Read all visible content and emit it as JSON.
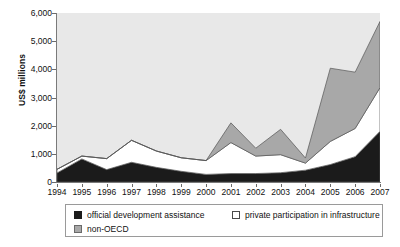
{
  "chart_data": {
    "type": "area",
    "stacked": true,
    "title": "",
    "xlabel": "",
    "ylabel": "US$ millions",
    "ylim": [
      0,
      6000
    ],
    "ytick_labels": [
      "0",
      "1,000",
      "2,000",
      "3,000",
      "4,000",
      "5,000",
      "6,000"
    ],
    "ytick_values": [
      0,
      1000,
      2000,
      3000,
      4000,
      5000,
      6000
    ],
    "grid": false,
    "legend_position": "bottom",
    "categories": [
      "1994",
      "1995",
      "1996",
      "1997",
      "1998",
      "1999",
      "2000",
      "2001",
      "2002",
      "2003",
      "2004",
      "2005",
      "2006",
      "2007"
    ],
    "series": [
      {
        "name": "official development assistance",
        "color": "#1b1b1b",
        "values": [
          320,
          820,
          440,
          700,
          520,
          380,
          270,
          300,
          300,
          330,
          420,
          620,
          900,
          1800
        ]
      },
      {
        "name": "private participation in infrastructure",
        "color": "#ffffff",
        "values": [
          130,
          100,
          390,
          780,
          580,
          480,
          490,
          1100,
          620,
          640,
          250,
          820,
          1000,
          1550
        ]
      },
      {
        "name": "non-OECD",
        "color": "#a8a8a8",
        "values": [
          0,
          0,
          0,
          0,
          0,
          0,
          0,
          700,
          280,
          900,
          180,
          2600,
          2000,
          2350
        ]
      }
    ]
  },
  "legend": {
    "items": [
      {
        "label": "official development assistance",
        "swatch": "oda"
      },
      {
        "label": "private participation in infrastructure",
        "swatch": "ppi"
      },
      {
        "label": "non-OECD",
        "swatch": "nonoecd"
      }
    ]
  }
}
